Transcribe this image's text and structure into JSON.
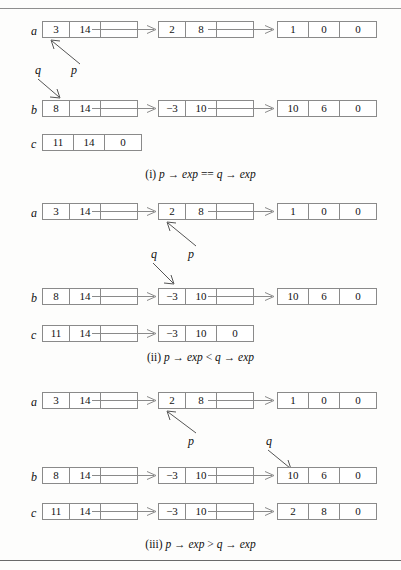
{
  "figure": {
    "type": "linked-list-diagram",
    "rules": [
      "top-rule",
      "bottom-rule"
    ]
  },
  "panels": [
    {
      "id": "panel-i",
      "caption": {
        "num": "(i)",
        "expr_left": "p",
        "arrow1": "→",
        "exp1": "exp",
        "op": "==",
        "expr_right": "q",
        "arrow2": "→",
        "exp2": "exp"
      },
      "lists": [
        {
          "name": "a",
          "nodes": [
            {
              "coef": "3",
              "exp": "14",
              "link": ""
            },
            {
              "coef": "2",
              "exp": "8",
              "link": ""
            },
            {
              "coef": "1",
              "exp": "0",
              "link": "0"
            }
          ]
        },
        {
          "name": "b",
          "nodes": [
            {
              "coef": "8",
              "exp": "14",
              "link": ""
            },
            {
              "coef": "−3",
              "exp": "10",
              "link": ""
            },
            {
              "coef": "10",
              "exp": "6",
              "link": "0"
            }
          ]
        },
        {
          "name": "c",
          "nodes": [
            {
              "coef": "11",
              "exp": "14",
              "link": "0"
            }
          ]
        }
      ],
      "pointers": [
        {
          "label": "p",
          "target": "a.node0"
        },
        {
          "label": "q",
          "target": "b.node0"
        }
      ]
    },
    {
      "id": "panel-ii",
      "caption": {
        "num": "(ii)",
        "expr_left": "p",
        "arrow1": "→",
        "exp1": "exp",
        "op": "<",
        "expr_right": "q",
        "arrow2": "→",
        "exp2": "exp"
      },
      "lists": [
        {
          "name": "a",
          "nodes": [
            {
              "coef": "3",
              "exp": "14",
              "link": ""
            },
            {
              "coef": "2",
              "exp": "8",
              "link": ""
            },
            {
              "coef": "1",
              "exp": "0",
              "link": "0"
            }
          ]
        },
        {
          "name": "b",
          "nodes": [
            {
              "coef": "8",
              "exp": "14",
              "link": ""
            },
            {
              "coef": "−3",
              "exp": "10",
              "link": ""
            },
            {
              "coef": "10",
              "exp": "6",
              "link": "0"
            }
          ]
        },
        {
          "name": "c",
          "nodes": [
            {
              "coef": "11",
              "exp": "14",
              "link": ""
            },
            {
              "coef": "−3",
              "exp": "10",
              "link": "0"
            }
          ]
        }
      ],
      "pointers": [
        {
          "label": "p",
          "target": "a.node1"
        },
        {
          "label": "q",
          "target": "b.node1"
        }
      ]
    },
    {
      "id": "panel-iii",
      "caption": {
        "num": "(iii)",
        "expr_left": "p",
        "arrow1": "→",
        "exp1": "exp",
        "op": ">",
        "expr_right": "q",
        "arrow2": "→",
        "exp2": "exp"
      },
      "lists": [
        {
          "name": "a",
          "nodes": [
            {
              "coef": "3",
              "exp": "14",
              "link": ""
            },
            {
              "coef": "2",
              "exp": "8",
              "link": ""
            },
            {
              "coef": "1",
              "exp": "0",
              "link": "0"
            }
          ]
        },
        {
          "name": "b",
          "nodes": [
            {
              "coef": "8",
              "exp": "14",
              "link": ""
            },
            {
              "coef": "−3",
              "exp": "10",
              "link": ""
            },
            {
              "coef": "10",
              "exp": "6",
              "link": "0"
            }
          ]
        },
        {
          "name": "c",
          "nodes": [
            {
              "coef": "11",
              "exp": "14",
              "link": ""
            },
            {
              "coef": "−3",
              "exp": "10",
              "link": ""
            },
            {
              "coef": "2",
              "exp": "8",
              "link": "0"
            }
          ]
        }
      ],
      "pointers": [
        {
          "label": "p",
          "target": "a.node1"
        },
        {
          "label": "q",
          "target": "b.node2"
        }
      ]
    }
  ]
}
